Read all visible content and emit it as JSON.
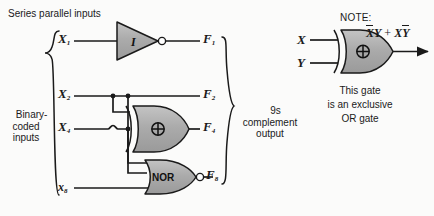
{
  "diagram": {
    "title": "Series parallel inputs",
    "input_group_label": "Binary-\ncoded\ninputs",
    "output_group_label": "9s\ncomplement\noutput",
    "inputs": [
      {
        "name": "X1",
        "label": "X",
        "subscript": "1",
        "case": "upper"
      },
      {
        "name": "X2",
        "label": "X",
        "subscript": "2",
        "case": "upper"
      },
      {
        "name": "X4",
        "label": "X",
        "subscript": "4",
        "case": "upper"
      },
      {
        "name": "x8",
        "label": "x",
        "subscript": "8",
        "case": "lower"
      }
    ],
    "outputs": [
      {
        "name": "F1",
        "label": "F",
        "subscript": "1"
      },
      {
        "name": "F2",
        "label": "F",
        "subscript": "2"
      },
      {
        "name": "F4",
        "label": "F",
        "subscript": "4"
      },
      {
        "name": "F8",
        "label": "F",
        "subscript": "8"
      }
    ],
    "gates": [
      {
        "name": "inverter",
        "type": "inverter",
        "label": "I",
        "inverted_output": true,
        "inputs": [
          "X1"
        ],
        "output": "F1"
      },
      {
        "name": "xor-gate",
        "type": "xor",
        "label": "⊕",
        "inverted_output": false,
        "inputs": [
          "X2",
          "X4"
        ],
        "output": "F4"
      },
      {
        "name": "nor-gate",
        "type": "nor",
        "label": "NOR",
        "inverted_output": true,
        "inputs": [
          "X2",
          "X4",
          "x8"
        ],
        "output": "F8"
      }
    ],
    "direct_connections": [
      {
        "from": "X2",
        "to": "F2"
      }
    ]
  },
  "note": {
    "heading": "NOTE:",
    "gate_symbol": "⊕",
    "inputs": [
      {
        "name": "X",
        "label": "X"
      },
      {
        "name": "Y",
        "label": "Y"
      }
    ],
    "expression": {
      "term1_a": "X",
      "term1_a_bar": true,
      "term1_b": "Y",
      "operator": "+",
      "term2_a": "X",
      "term2_b": "Y",
      "term2_b_bar": true,
      "plain": "X̄Y + XȲ"
    },
    "caption_line1": "This gate",
    "caption_line2": "is an exclusive",
    "caption_line3": "OR gate"
  },
  "colors": {
    "background": "#fbfbfa",
    "gate_fill": "#a9a9a9",
    "gate_fill_light": "#c2c2c2",
    "stroke": "#1a1a1a",
    "text": "#1a1a1a",
    "bubble_fill": "#ffffff"
  }
}
